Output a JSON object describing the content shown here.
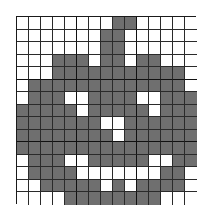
{
  "puzzle": {
    "type": "nonogram-grid",
    "rows": 15,
    "cols": 15,
    "colors": {
      "filled": "#6f6f6f",
      "empty": "#ffffff",
      "grid_line": "#2a2a2a"
    },
    "grid": [
      "000000001100000",
      "000000011000000",
      "000000011000000",
      "000111011011000",
      "000111111111110",
      "011111111111110",
      "011100111100111",
      "111110111110111",
      "111111100111111",
      "111111110111111",
      "111111111111111",
      "011100111110011",
      "011110000000110",
      "001111101011110",
      "000011111111000"
    ]
  }
}
